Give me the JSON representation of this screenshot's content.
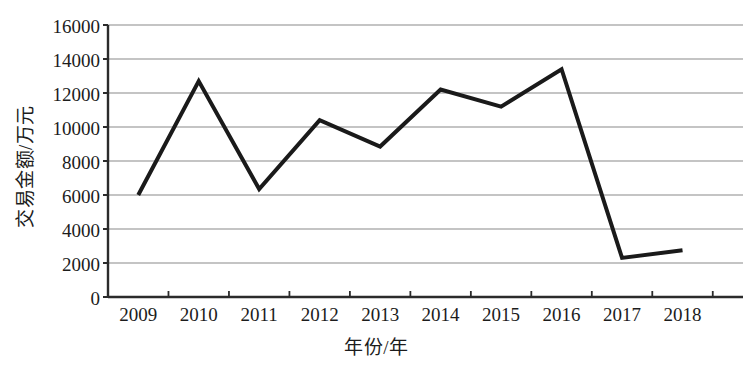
{
  "chart_data": {
    "type": "line",
    "title": "",
    "xlabel": "年份/年",
    "ylabel": "交易金额/万元",
    "categories": [
      "2009",
      "2010",
      "2011",
      "2012",
      "2013",
      "2014",
      "2015",
      "2016",
      "2017",
      "2018"
    ],
    "values": [
      6000,
      12700,
      6350,
      10400,
      8850,
      12200,
      11200,
      13400,
      2300,
      2750
    ],
    "series": [
      {
        "name": "交易金额",
        "values": [
          6000,
          12700,
          6350,
          10400,
          8850,
          12200,
          11200,
          13400,
          2300,
          2750
        ]
      }
    ],
    "ylim": [
      0,
      16000
    ],
    "ytick_labels": [
      "0",
      "2000",
      "4000",
      "6000",
      "8000",
      "10000",
      "12000",
      "14000",
      "16000"
    ],
    "ytick_values": [
      0,
      2000,
      4000,
      6000,
      8000,
      10000,
      12000,
      14000,
      16000
    ],
    "grid": true,
    "grid_axis": "y",
    "legend": "none",
    "legend_position": "none",
    "line_color": "#1a1a1a",
    "grid_color": "#8a8a8a",
    "axis_color": "#2b2b2b",
    "background_color": "#ffffff",
    "markers": false,
    "line_width": 4
  }
}
